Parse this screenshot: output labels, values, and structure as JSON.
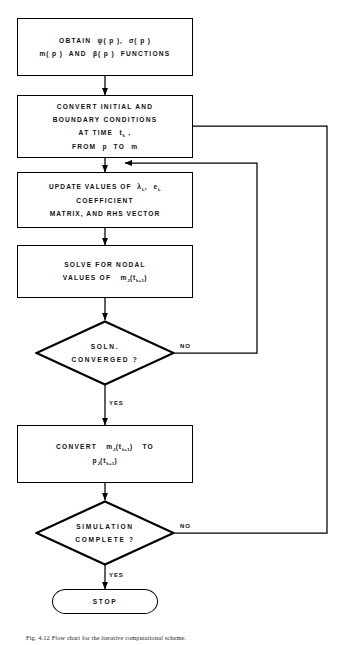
{
  "figure": {
    "type": "flowchart",
    "caption": "Fig. 4.12  Flow chart for the iterative computational scheme.",
    "orientation": "vertical top-to-bottom with two right-side feedback loops"
  },
  "nodes": [
    {
      "id": "obtain-functions",
      "shape": "process",
      "lines": [
        "OBTAIN  ψ( p ),  σ( p )",
        "m( p )  AND  β( p )  FUNCTIONS"
      ]
    },
    {
      "id": "convert-initial-boundary",
      "shape": "process",
      "lines": [
        "CONVERT  INITIAL  AND",
        "BOUNDARY  CONDITIONS",
        "AT TIME  t k ,",
        "FROM  p  TO  m"
      ]
    },
    {
      "id": "update-values",
      "shape": "process",
      "lines": [
        "UPDATE  VALUES  OF  λ L ,  e L",
        "COEFFICIENT",
        "MATRIX,  AND  RHS  VECTOR"
      ]
    },
    {
      "id": "solve-nodal",
      "shape": "process",
      "lines": [
        "SOLVE  FOR  NODAL",
        "VALUES  OF  m J ( t k+1 )"
      ]
    },
    {
      "id": "soln-converged",
      "shape": "decision",
      "lines": [
        "SOLN.",
        "CONVERGED ?"
      ]
    },
    {
      "id": "convert-m-to-p",
      "shape": "process",
      "lines": [
        "CONVERT  m J ( t k+1 )  TO",
        "p J ( t k+1 )"
      ]
    },
    {
      "id": "simulation-complete",
      "shape": "decision",
      "lines": [
        "SIMULATION",
        "COMPLETE ?"
      ]
    },
    {
      "id": "stop",
      "shape": "terminator",
      "lines": [
        "STOP"
      ]
    }
  ],
  "text": {
    "box1_line1_a": "OBTAIN",
    "box1_psi": "ψ",
    "box1_sigma": "σ",
    "box1_line2_m": "m",
    "box1_and": "AND",
    "box1_beta": "β",
    "box1_functions": "FUNCTIONS",
    "box2_line1": "CONVERT  INITIAL  AND",
    "box2_line2": "BOUNDARY  CONDITIONS",
    "box2_line3_pre": "AT TIME",
    "box2_line3_var": "t",
    "box2_line3_sub": "k",
    "box2_line3_post": ",",
    "box2_line4_pre": "FROM",
    "box2_line4_p": "p",
    "box2_line4_to": "TO",
    "box2_line4_m": "m",
    "box3_line1_pre": "UPDATE  VALUES  OF",
    "box3_lambda": "λ",
    "box3_lambda_sub": "L",
    "box3_comma": ",",
    "box3_e": "e",
    "box3_e_sub": "L",
    "box3_line2": "COEFFICIENT",
    "box3_line3": "MATRIX,  AND  RHS  VECTOR",
    "box4_line1": "SOLVE  FOR  NODAL",
    "box4_line2_pre": "VALUES  OF",
    "box4_m": "m",
    "box4_m_sub": "J",
    "box4_t": "t",
    "box4_t_sub": "k+1",
    "dia1_line1": "SOLN.",
    "dia1_line2": "CONVERGED ?",
    "box5_pre": "CONVERT",
    "box5_m": "m",
    "box5_m_sub": "J",
    "box5_t1": "t",
    "box5_t1_sub": "k+1",
    "box5_to": "TO",
    "box5_p": "p",
    "box5_p_sub": "J",
    "box5_t2": "t",
    "box5_t2_sub": "k+1",
    "dia2_line1": "SIMULATION",
    "dia2_line2": "COMPLETE ?",
    "stop_label": "STOP",
    "no_label_1": "NO",
    "yes_label_1": "YES",
    "no_label_2": "NO",
    "yes_label_2": "YES",
    "caption": "Fig. 4.12  Flow chart for the iterative computational scheme."
  },
  "colors": {
    "ink": "#000000",
    "paper": "#ffffff",
    "caption_ink": "#1b1b1b"
  }
}
